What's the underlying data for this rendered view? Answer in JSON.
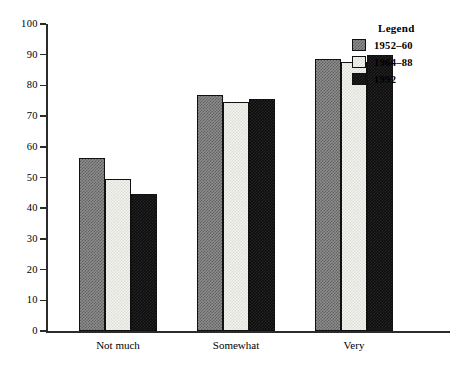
{
  "chart_data": {
    "type": "bar",
    "title": "",
    "xlabel": "",
    "ylabel": "",
    "ylim": [
      0,
      100
    ],
    "ytick_step": 10,
    "yticks": [
      "0",
      "10",
      "20",
      "30",
      "40",
      "50",
      "60",
      "70",
      "80",
      "90",
      "100"
    ],
    "grid": false,
    "categories": [
      "Not much",
      "Somewhat",
      "Very"
    ],
    "legend_position": "top-right",
    "series": [
      {
        "name": "1952–60",
        "values": [
          56.5,
          77.0,
          88.5
        ],
        "fill": "checkered-gray",
        "color": "#8d8d8d"
      },
      {
        "name": "1964–88",
        "values": [
          49.5,
          74.5,
          87.5
        ],
        "fill": "light-stipple",
        "color": "#f2f2ee"
      },
      {
        "name": "1992",
        "values": [
          44.5,
          75.5,
          90.0
        ],
        "fill": "solid-black",
        "color": "#0d0d0d"
      }
    ]
  },
  "legend": {
    "title": "Legend"
  }
}
